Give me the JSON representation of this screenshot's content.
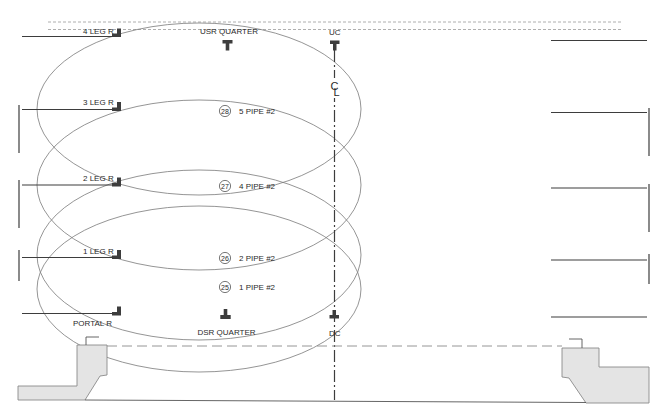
{
  "drawing": {
    "top_labels": {
      "usr_quarter": "USR QUARTER",
      "uc": "UC"
    },
    "bottom_labels": {
      "dsr_quarter": "DSR QUARTER",
      "dc": "DC"
    },
    "legs": [
      {
        "label": "4 LEG R"
      },
      {
        "label": "3 LEG R"
      },
      {
        "label": "2 LEG R"
      },
      {
        "label": "1 LEG R"
      },
      {
        "label": "PORTAL R"
      }
    ],
    "pipes": [
      {
        "number": "28",
        "label": "5 PIPE #2"
      },
      {
        "number": "27",
        "label": "4 PIPE #2"
      },
      {
        "number": "26",
        "label": "2 PIPE #2"
      },
      {
        "number": "25",
        "label": "1 PIPE #2"
      }
    ],
    "centerline": {
      "c": "C",
      "l": "L"
    }
  },
  "colors": {
    "line": "#3d3d3d",
    "ellipse": "#7a7a7a",
    "dash": "#9a9a9a",
    "platform_fill": "#e4e4e4"
  }
}
